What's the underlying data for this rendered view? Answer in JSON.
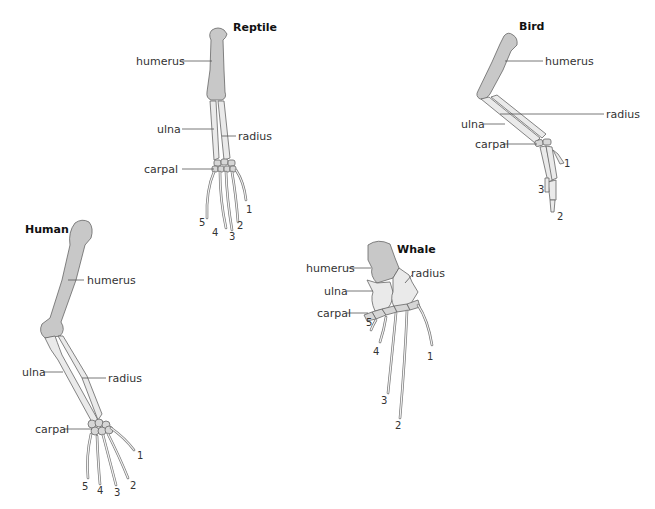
{
  "diagram": {
    "type": "homologous-forelimb-comparison",
    "colors": {
      "humerus": "#c8c8c8",
      "forearm": "#eaeaea",
      "carpal": "#d6d6d6",
      "outline": "#666666",
      "text": "#333333"
    },
    "panels": {
      "reptile": {
        "title": "Reptile",
        "labels": {
          "humerus": "humerus",
          "ulna": "ulna",
          "radius": "radius",
          "carpal": "carpal"
        },
        "digits": [
          "1",
          "2",
          "3",
          "4",
          "5"
        ]
      },
      "bird": {
        "title": "Bird",
        "labels": {
          "humerus": "humerus",
          "ulna": "ulna",
          "radius": "radius",
          "carpal": "carpal"
        },
        "digits": [
          "1",
          "2",
          "3"
        ]
      },
      "human": {
        "title": "Human",
        "labels": {
          "humerus": "humerus",
          "ulna": "ulna",
          "radius": "radius",
          "carpal": "carpal"
        },
        "digits": [
          "1",
          "2",
          "3",
          "4",
          "5"
        ]
      },
      "whale": {
        "title": "Whale",
        "labels": {
          "humerus": "humerus",
          "ulna": "ulna",
          "radius": "radius",
          "carpal": "carpal"
        },
        "digits": [
          "1",
          "2",
          "3",
          "4",
          "5"
        ]
      }
    }
  }
}
